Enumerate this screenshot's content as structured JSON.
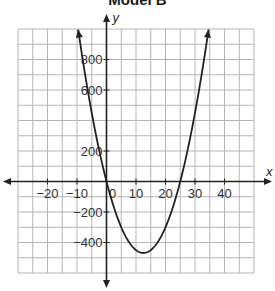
{
  "chart_data": {
    "type": "line",
    "title": "Model B",
    "xlabel": "x",
    "ylabel": "y",
    "xlim": [
      -30,
      50
    ],
    "ylim": [
      -600,
      1000
    ],
    "grid": true,
    "grid_step": {
      "x": 5,
      "y": 100
    },
    "x_ticks": [
      -20,
      -10,
      0,
      10,
      20,
      30,
      40
    ],
    "x_tick_labels": [
      "−20",
      "−10",
      "0",
      "10",
      "20",
      "30",
      "40"
    ],
    "y_ticks": [
      800,
      600,
      200,
      -200,
      -400
    ],
    "y_tick_labels": [
      "800",
      "600",
      "200",
      "−200",
      "−400"
    ],
    "series": [
      {
        "name": "parabola",
        "equation": "y = 3x(x - 25)",
        "x_intercepts": [
          0,
          25
        ],
        "vertex": [
          12.5,
          -468.75
        ],
        "x": [
          -9.6,
          -5,
          0,
          5,
          10,
          12.5,
          15,
          20,
          25,
          30,
          34.6
        ],
        "values": [
          1000,
          450,
          0,
          -300,
          -450,
          -468.75,
          -450,
          -300,
          0,
          450,
          1000
        ]
      }
    ],
    "colors": {
      "grid": "#b5b5b5",
      "axes": "#222222",
      "curve": "#222222"
    }
  }
}
